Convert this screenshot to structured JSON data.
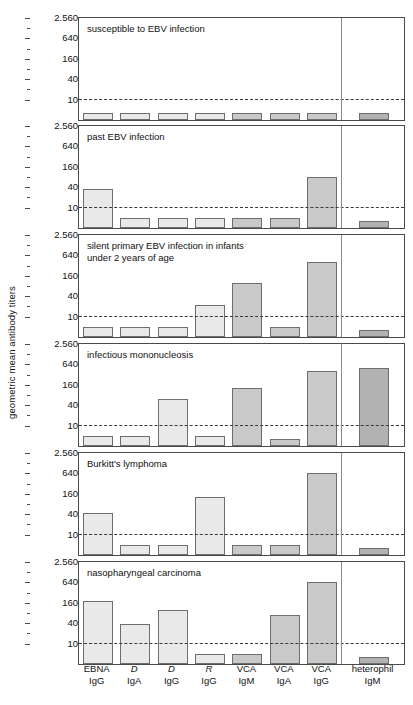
{
  "figure": {
    "ylabel": "geometric mean antibody titers"
  },
  "chart_data": {
    "type": "bar",
    "title": "",
    "xlabel": "",
    "ylabel": "geometric mean antibody titers",
    "scale": "log",
    "ylim": [
      2.5,
      2560
    ],
    "yticks": [
      10,
      40,
      160,
      640,
      2560
    ],
    "ytick_labels": [
      "10",
      "40",
      "160",
      "640",
      "2.560"
    ],
    "grid": false,
    "cutoff_line": 10,
    "legend": "none",
    "categories": [
      {
        "line1": "EBNA",
        "line2": "IgG",
        "italic": false,
        "group": "light"
      },
      {
        "line1": "D",
        "line2": "IgA",
        "italic": true,
        "group": "light"
      },
      {
        "line1": "D",
        "line2": "IgG",
        "italic": true,
        "group": "light"
      },
      {
        "line1": "R",
        "line2": "IgG",
        "italic": true,
        "group": "light"
      },
      {
        "line1": "VCA",
        "line2": "IgM",
        "italic": false,
        "group": "mid"
      },
      {
        "line1": "VCA",
        "line2": "IgA",
        "italic": false,
        "group": "mid"
      },
      {
        "line1": "VCA",
        "line2": "IgG",
        "italic": false,
        "group": "mid"
      },
      {
        "line1": "heterophil",
        "line2": "IgM",
        "italic": false,
        "group": "dark"
      }
    ],
    "series": [
      {
        "name": "susceptible to EBV infection",
        "panel_title": "susceptible to EBV infection",
        "values": [
          4,
          4,
          4,
          4,
          4,
          4,
          4,
          4
        ]
      },
      {
        "name": "past EBV infection",
        "panel_title": "past EBV infection",
        "values": [
          35,
          5,
          5,
          5,
          5,
          5,
          80,
          4
        ]
      },
      {
        "name": "silent primary EBV infection in infants under 2 years of age",
        "panel_title": "silent primary EBV infection in infants\nunder 2 years of age",
        "values": [
          5,
          5,
          5,
          22,
          100,
          5,
          400,
          4
        ]
      },
      {
        "name": "infectious mononucleosis",
        "panel_title": "infectious mononucleosis",
        "values": [
          5,
          5,
          60,
          5,
          130,
          4,
          400,
          500
        ]
      },
      {
        "name": "Burkitt's lymphoma",
        "panel_title": "Burkitt's lymphoma",
        "values": [
          42,
          5,
          5,
          125,
          5,
          5,
          660,
          4
        ]
      },
      {
        "name": "nasopharyngeal carcinoma",
        "panel_title": "nasopharyngeal carcinoma",
        "values": [
          180,
          37,
          100,
          5,
          5,
          70,
          660,
          4
        ]
      }
    ],
    "colors": {
      "light": "#e9e9e9",
      "mid": "#c9c9c9",
      "dark": "#b2b2b2",
      "bar_border": "#6e6e6e",
      "panel_border": "#4a4a4a",
      "cutoff": "#3a3a3a",
      "divider": "#8a8a8a",
      "background": "#ffffff"
    }
  }
}
